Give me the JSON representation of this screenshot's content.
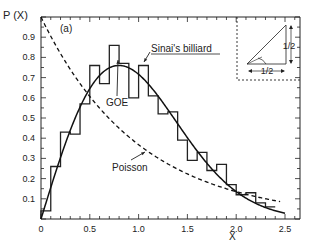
{
  "chart_data": {
    "type": "line",
    "title": "",
    "panel_label": "(a)",
    "xlabel": "X",
    "ylabel": "P (X)",
    "xlim": [
      0,
      2.6
    ],
    "ylim": [
      0,
      1.0
    ],
    "x_ticks": [
      "0",
      "0.5",
      "1.0",
      "1.5",
      "2.0",
      "2.5"
    ],
    "y_ticks": [
      "0.1",
      "0.2",
      "0.3",
      "0.4",
      "0.5",
      "0.6",
      "0.7",
      "0.8",
      "0.9"
    ],
    "grid": false,
    "series": [
      {
        "name": "Sinai's billiard",
        "kind": "histogram",
        "bin_width": 0.1,
        "bin_edges": [
          0,
          0.1,
          0.2,
          0.3,
          0.4,
          0.5,
          0.6,
          0.7,
          0.8,
          0.9,
          1.0,
          1.1,
          1.2,
          1.3,
          1.4,
          1.5,
          1.6,
          1.7,
          1.8,
          1.9,
          2.0,
          2.1,
          2.2,
          2.3,
          2.4
        ],
        "values": [
          0.04,
          0.26,
          0.43,
          0.42,
          0.57,
          0.76,
          0.67,
          0.86,
          0.77,
          0.6,
          0.76,
          0.61,
          0.52,
          0.53,
          0.39,
          0.29,
          0.33,
          0.24,
          0.27,
          0.17,
          0.12,
          0.13,
          0.08,
          0.06
        ]
      },
      {
        "name": "GOE",
        "kind": "curve",
        "style": "solid",
        "formula": "(pi/2) x exp(-pi x^2 / 4)"
      },
      {
        "name": "Poisson",
        "kind": "curve",
        "style": "dashed",
        "formula": "exp(-x)"
      }
    ],
    "annotations": [
      {
        "text": "Sinai's billiard",
        "underlined": true
      },
      {
        "text": "GOE"
      },
      {
        "text": "Poisson"
      }
    ],
    "inset": {
      "description": "Sinai billiard triangle geometry",
      "labels": [
        "1/2",
        "1/2"
      ]
    }
  }
}
